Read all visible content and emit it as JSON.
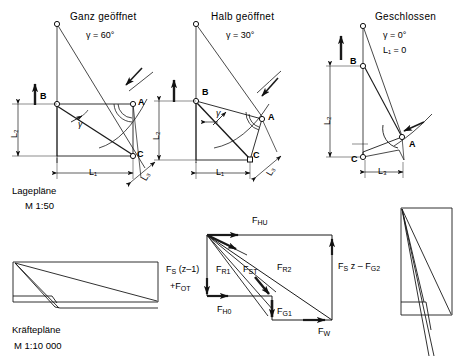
{
  "figure": {
    "panels": [
      {
        "id": "panel-open",
        "title": "Ganz geöffnet",
        "angle_label": "γ = 60°",
        "extra_label": "",
        "points": [
          "B",
          "A",
          "C"
        ],
        "dims": [
          "L₁",
          "L₂",
          "L₃"
        ]
      },
      {
        "id": "panel-half",
        "title": "Halb geöffnet",
        "angle_label": "γ = 30°",
        "extra_label": "",
        "points": [
          "B",
          "A",
          "C"
        ],
        "dims": [
          "L₁",
          "L₂",
          "L₃"
        ]
      },
      {
        "id": "panel-closed",
        "title": "Geschlossen",
        "angle_label": "γ = 0°",
        "extra_label": "L₁ = 0",
        "points": [
          "B",
          "A",
          "C"
        ],
        "dims": [
          "L₂",
          "L₃"
        ]
      }
    ],
    "captions": {
      "position_plans_title": "Lagepläne",
      "position_plans_scale": "M 1:50",
      "force_plans_title": "Kräftepläne",
      "force_plans_scale": "M 1:10 000"
    },
    "force_diagram": {
      "labels": {
        "top": "F",
        "top_sub": "HU",
        "right_line1": "F",
        "right_sub1": "S",
        "right_rest": " z – F",
        "right_sub2": "G2",
        "left_line1": "F",
        "left_sub1": "S",
        "left_rest1": " (z–1)",
        "left_line2": "+F",
        "left_sub2": "OT",
        "fr1": "F",
        "fr1_sub": "R1",
        "fst": "F",
        "fst_sub": "ST",
        "fr2": "F",
        "fr2_sub": "R2",
        "fh0": "F",
        "fh0_sub": "H0",
        "fg1": "F",
        "fg1_sub": "G1",
        "fw": "F",
        "fw_sub": "W"
      }
    },
    "colors": {
      "stroke": "#1a1a1a",
      "thin": "#3a3a3a",
      "background": "#ffffff"
    }
  }
}
